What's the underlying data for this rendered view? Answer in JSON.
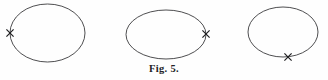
{
  "figure": {
    "caption": "Fig. 5.",
    "background_color": "#fefefe",
    "curve_color": "#3a3a3c",
    "mark_color": "#1d1d1f",
    "mark_glyph": "x-cross-mark",
    "shape_type": "ellipse",
    "count": 3,
    "diagrams": [
      {
        "name": "ellipse-left-marked",
        "label": "",
        "center_x": 47.5,
        "center_y": 33,
        "radius_x": 37.5,
        "radius_y": 29,
        "mark_position": "left-vertex",
        "mark_x": 10,
        "mark_y": 33
      },
      {
        "name": "ellipse-right-marked",
        "label": "",
        "center_x": 166,
        "center_y": 34.5,
        "radius_x": 40,
        "radius_y": 24.5,
        "mark_position": "right-vertex",
        "mark_x": 206,
        "mark_y": 34
      },
      {
        "name": "ellipse-bottom-marked",
        "label": "",
        "center_x": 283,
        "center_y": 32,
        "radius_x": 35,
        "radius_y": 25,
        "mark_position": "bottom-vertex",
        "mark_x": 288,
        "mark_y": 57
      }
    ]
  }
}
